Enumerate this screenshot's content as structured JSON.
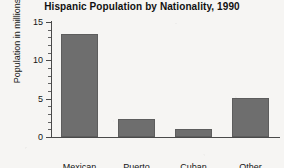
{
  "chart_data": {
    "type": "bar",
    "title": "Hispanic Population by Nationality, 1990",
    "xlabel": "",
    "ylabel": "Population in millions",
    "categories": [
      "Mexican",
      "Puerto Rican",
      "Cuban",
      "Other"
    ],
    "category_lines": [
      [
        "Mexican"
      ],
      [
        "Puerto",
        "Rican"
      ],
      [
        "Cuban"
      ],
      [
        "Other"
      ]
    ],
    "values": [
      13.5,
      2.3,
      1.0,
      5.1
    ],
    "ylim": [
      0,
      15
    ],
    "y_major_ticks": [
      0,
      5,
      10,
      15
    ],
    "y_tick_labels": [
      "0",
      "5",
      "10",
      "15"
    ],
    "y_minor_tick_interval": 1,
    "grid": false,
    "legend": null,
    "bar_color": "#6e6e6e",
    "axis_color": "#4a4a4a",
    "background_color": "#f6f5f3"
  }
}
